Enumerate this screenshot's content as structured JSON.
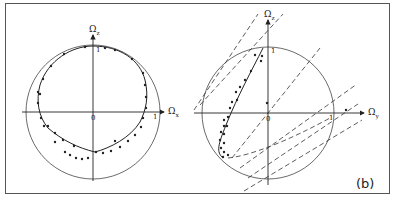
{
  "figure": {
    "panel_label": "(b)",
    "left_panel": {
      "vertical_axis_label": "Ω",
      "vertical_axis_sub": "z",
      "horizontal_axis_label": "Ω",
      "horizontal_axis_sub": "x",
      "origin_label": "0",
      "unit_tick_vertical": "1",
      "unit_tick_horizontal": "1"
    },
    "right_panel": {
      "vertical_axis_label": "Ω",
      "vertical_axis_sub": "z",
      "horizontal_axis_label": "Ω",
      "horizontal_axis_sub": "y",
      "origin_label": "0",
      "unit_tick_vertical": "1",
      "unit_tick_horizontal": "1"
    }
  },
  "colors": {
    "ink": "#222222",
    "frame": "#555555",
    "background": "#ffffff"
  }
}
